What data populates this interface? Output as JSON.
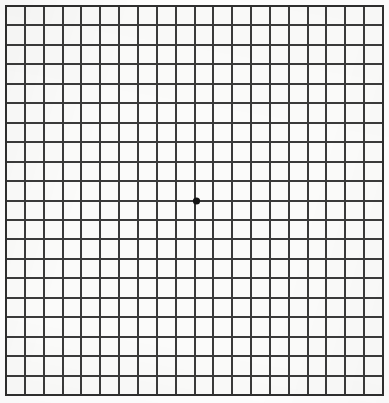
{
  "chart": {
    "name": "Amsler grid",
    "type": "grid",
    "columns": 20,
    "rows": 20,
    "cell_size_px": 18.85,
    "grid_left_px": 6,
    "grid_top_px": 6,
    "grid_width_px": 377,
    "grid_height_px": 389,
    "line_width_px": 2,
    "line_color": "#3a3a3a",
    "border_color": "#2e2e2e",
    "cell_background": "#fbfbfa",
    "page_background": "#ffffff"
  },
  "fixation_point": {
    "label": "central fixation dot",
    "shape": "circle",
    "center_x_px": 196.5,
    "center_y_px": 201,
    "radius_px": 3.6,
    "color": "#141414",
    "grid_column": 10,
    "grid_row": 10
  },
  "labels": {
    "title": "",
    "subtitle": "",
    "caption": ""
  }
}
